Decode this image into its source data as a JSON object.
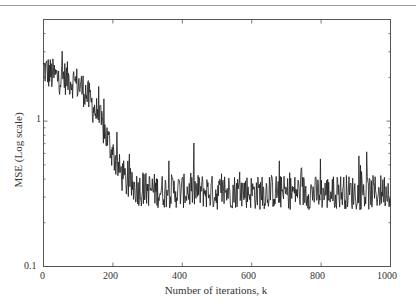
{
  "chart_data": {
    "type": "line",
    "title": "",
    "xlabel": "Number of iterations, k",
    "ylabel": "MSE (Log scale)",
    "xlim": [
      0,
      1000
    ],
    "ylim": [
      0.1,
      5
    ],
    "yscale": "log",
    "grid": false,
    "legend": null,
    "x_ticks": [
      0,
      200,
      400,
      600,
      800,
      1000
    ],
    "x_tick_labels": [
      "0",
      "200",
      "400",
      "600",
      "800",
      "1000"
    ],
    "y_ticks": [
      0.1,
      1
    ],
    "y_tick_labels": [
      "0.1",
      "1"
    ],
    "series": [
      {
        "name": "MSE",
        "color": "#1a1a1a",
        "x": [
          0,
          20,
          40,
          60,
          80,
          100,
          120,
          140,
          160,
          180,
          200,
          220,
          240,
          260,
          280,
          300,
          340,
          380,
          420,
          460,
          500,
          540,
          580,
          620,
          660,
          700,
          740,
          780,
          820,
          860,
          900,
          940,
          980,
          1000
        ],
        "values": [
          2.3,
          2.1,
          2.0,
          2.0,
          1.9,
          1.8,
          1.6,
          1.3,
          1.05,
          0.8,
          0.6,
          0.45,
          0.38,
          0.35,
          0.34,
          0.34,
          0.33,
          0.33,
          0.33,
          0.33,
          0.32,
          0.33,
          0.33,
          0.32,
          0.33,
          0.32,
          0.33,
          0.32,
          0.32,
          0.33,
          0.32,
          0.32,
          0.33,
          0.34
        ],
        "noise_band_steady_state": [
          0.22,
          0.6
        ]
      }
    ]
  },
  "labels": {
    "ylabel": "MSE (Log scale)",
    "xlabel": "Number of iterations, k",
    "y_1": "1",
    "y_01": "0.1",
    "x0": "0",
    "x200": "200",
    "x400": "400",
    "x600": "600",
    "x800": "800",
    "x1000": "1000"
  }
}
